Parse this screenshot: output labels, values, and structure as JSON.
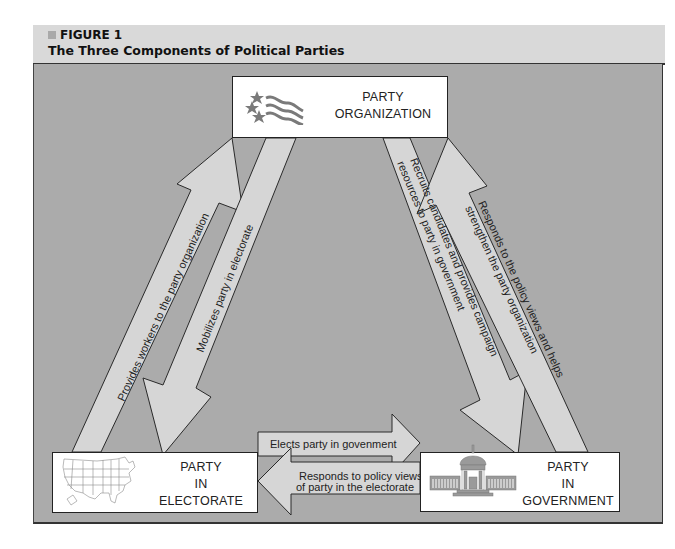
{
  "figure": {
    "label": "FIGURE 1",
    "title": "The Three Components of Political Parties"
  },
  "nodes": {
    "organization": {
      "line1": "PARTY",
      "line2": "ORGANIZATION",
      "icon": "flag-stars-icon"
    },
    "electorate": {
      "line1": "PARTY",
      "line2": "IN",
      "line3": "ELECTORATE",
      "icon": "us-map-icon"
    },
    "government": {
      "line1": "PARTY",
      "line2": "IN",
      "line3": "GOVERNMENT",
      "icon": "capitol-building-icon"
    }
  },
  "edges": {
    "electorate_to_org": {
      "text": "Provides workers to the party organization"
    },
    "org_to_electorate": {
      "text": "Mobilizes party in electorate"
    },
    "org_to_government": {
      "line1": "Recruits candidates and provides campaign",
      "line2": "resources to party in government"
    },
    "government_to_org": {
      "line1": "Responds to the policy views and helps",
      "line2": "strengthen the party organization"
    },
    "electorate_to_government": {
      "text": "Elects party in govenment"
    },
    "government_to_electorate": {
      "line1": "Responds to policy views",
      "line2": "of party in the electorate"
    }
  },
  "colors": {
    "panel": "#ababab",
    "header": "#d9d9d9",
    "arrow_fill": "#d6d6d6",
    "icon_gray": "#8a8a8a"
  }
}
